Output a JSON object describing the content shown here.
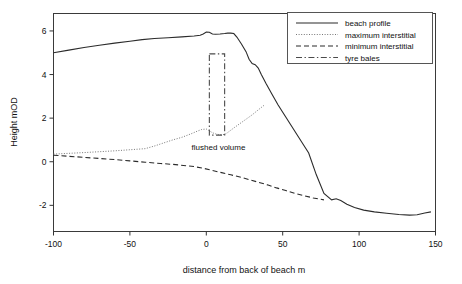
{
  "chart_data": {
    "type": "line",
    "title": "",
    "xlabel": "distance from back of beach m",
    "ylabel": "Height mOD",
    "xlim": [
      -100,
      150
    ],
    "ylim": [
      -3.2,
      6.8
    ],
    "xticks": [
      -100,
      -50,
      0,
      50,
      100,
      150
    ],
    "yticks": [
      6,
      4,
      2,
      0,
      -2
    ],
    "xtick_labels": [
      "-100",
      "-50",
      "0",
      "50",
      "100",
      "150"
    ],
    "ytick_labels": [
      "6",
      "4",
      "2",
      "0",
      "-2"
    ],
    "grid": false,
    "legend_position": "top-right",
    "series": [
      {
        "name": "beach profile",
        "style": "solid",
        "color": "#2b2b2b",
        "x": [
          -100,
          -90,
          -80,
          -70,
          -60,
          -50,
          -42,
          -34,
          -25,
          -16,
          -8,
          -4,
          -2,
          0,
          2,
          4,
          6,
          9,
          12,
          14,
          16,
          18,
          20,
          23,
          26,
          28,
          30,
          32,
          34,
          36,
          39,
          43,
          47,
          52,
          57,
          62,
          67,
          72,
          77,
          82,
          85,
          88,
          92,
          97,
          103,
          110,
          118,
          126,
          133,
          138,
          143,
          147
        ],
        "y": [
          5.0,
          5.12,
          5.24,
          5.34,
          5.44,
          5.53,
          5.6,
          5.65,
          5.69,
          5.73,
          5.77,
          5.8,
          5.86,
          5.95,
          5.94,
          5.86,
          5.85,
          5.86,
          5.88,
          5.9,
          5.9,
          5.88,
          5.72,
          5.4,
          5.05,
          4.7,
          4.5,
          4.45,
          4.3,
          4.0,
          3.6,
          3.1,
          2.6,
          2.05,
          1.5,
          0.95,
          0.4,
          -0.6,
          -1.45,
          -1.75,
          -1.7,
          -1.78,
          -1.95,
          -2.1,
          -2.22,
          -2.3,
          -2.36,
          -2.42,
          -2.45,
          -2.43,
          -2.35,
          -2.3
        ]
      },
      {
        "name": "maximum interstitial",
        "style": "dotted",
        "color": "#777777",
        "x": [
          -100,
          -80,
          -60,
          -50,
          -44,
          -40,
          -34,
          -28,
          -22,
          -16,
          -10,
          -6,
          -3,
          0,
          2,
          4,
          6,
          8,
          10,
          12,
          14,
          18,
          22,
          26,
          30,
          34,
          38
        ],
        "y": [
          0.35,
          0.42,
          0.5,
          0.55,
          0.58,
          0.6,
          0.72,
          0.86,
          1.0,
          1.12,
          1.28,
          1.4,
          1.48,
          1.5,
          1.42,
          1.33,
          1.28,
          1.25,
          1.24,
          1.25,
          1.34,
          1.55,
          1.75,
          1.95,
          2.15,
          2.38,
          2.6
        ]
      },
      {
        "name": "minimum interstitial",
        "style": "dashed",
        "color": "#2b2b2b",
        "x": [
          -100,
          -90,
          -80,
          -70,
          -60,
          -50,
          -40,
          -30,
          -22,
          -15,
          -8,
          -2,
          4,
          10,
          16,
          22,
          28,
          34,
          40,
          46,
          52,
          58,
          64,
          70,
          77
        ],
        "y": [
          0.3,
          0.25,
          0.2,
          0.15,
          0.1,
          0.04,
          -0.02,
          -0.08,
          -0.12,
          -0.17,
          -0.22,
          -0.3,
          -0.4,
          -0.5,
          -0.6,
          -0.7,
          -0.82,
          -0.94,
          -1.06,
          -1.2,
          -1.32,
          -1.45,
          -1.56,
          -1.66,
          -1.75
        ]
      },
      {
        "name": "tyre bales",
        "style": "dash-dot",
        "color": "#4a4a4a",
        "shape": "rectangle",
        "x_range": [
          2.0,
          12.0
        ],
        "y_range": [
          1.22,
          4.95
        ]
      }
    ],
    "annotations": [
      {
        "text": "flushed volume",
        "x": 8,
        "y": 0.55
      }
    ],
    "legend_entries": [
      {
        "label": "beach profile",
        "style": "solid"
      },
      {
        "label": "maximum interstitial",
        "style": "dotted"
      },
      {
        "label": "minimum interstitial",
        "style": "dashed"
      },
      {
        "label": "tyre bales",
        "style": "dash-dot"
      }
    ]
  }
}
